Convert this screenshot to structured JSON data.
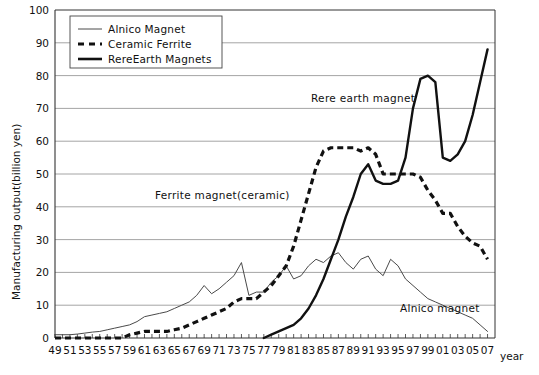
{
  "chart_data": {
    "type": "line",
    "title": "",
    "xlabel": "year",
    "ylabel": "Manufacturing output(billion yen)",
    "ylim": [
      0,
      100
    ],
    "ytick_step": 10,
    "yticks": [
      0,
      10,
      20,
      30,
      40,
      50,
      60,
      70,
      80,
      90,
      100
    ],
    "xlim": [
      49,
      108
    ],
    "xticks_labeled": [
      "49",
      "51",
      "53",
      "55",
      "57",
      "59",
      "61",
      "63",
      "65",
      "67",
      "69",
      "71",
      "73",
      "75",
      "77",
      "79",
      "81",
      "83",
      "85",
      "87",
      "89",
      "91",
      "93",
      "95",
      "97",
      "99",
      "01",
      "03",
      "05",
      "07"
    ],
    "xtick_minor_every_year": true,
    "grid": "horizontal",
    "legend_position": "top-left-inside",
    "series": [
      {
        "name": "Alnico Magnet",
        "style": "thin-solid",
        "color": "#4a4a4a",
        "x": [
          49,
          50,
          51,
          52,
          53,
          54,
          55,
          56,
          57,
          58,
          59,
          60,
          61,
          62,
          63,
          64,
          65,
          66,
          67,
          68,
          69,
          70,
          71,
          72,
          73,
          74,
          75,
          76,
          77,
          78,
          79,
          80,
          81,
          82,
          83,
          84,
          85,
          86,
          87,
          88,
          89,
          90,
          91,
          92,
          93,
          94,
          95,
          96,
          97,
          98,
          99,
          100,
          101,
          102,
          103,
          104,
          105,
          106,
          107
        ],
        "values": [
          1,
          1,
          1,
          1.2,
          1.5,
          1.8,
          2,
          2.5,
          3,
          3.5,
          4,
          5,
          6.5,
          7,
          7.5,
          8,
          9,
          10,
          11,
          13,
          16,
          13.5,
          15,
          17,
          19,
          23,
          13,
          14,
          14,
          17,
          19,
          22,
          18,
          19,
          22,
          24,
          23,
          25,
          26,
          23,
          21,
          24,
          25,
          21,
          19,
          24,
          22,
          18,
          16,
          14,
          12,
          11,
          10,
          9,
          8,
          7,
          6,
          4,
          2
        ]
      },
      {
        "name": "Ceramic Ferrite",
        "style": "thick-dashed",
        "color": "#111111",
        "x": [
          49,
          50,
          51,
          52,
          53,
          54,
          55,
          56,
          57,
          58,
          59,
          60,
          61,
          62,
          63,
          64,
          65,
          66,
          67,
          68,
          69,
          70,
          71,
          72,
          73,
          74,
          75,
          76,
          77,
          78,
          79,
          80,
          81,
          82,
          83,
          84,
          85,
          86,
          87,
          88,
          89,
          90,
          91,
          92,
          93,
          94,
          95,
          96,
          97,
          98,
          99,
          100,
          101,
          102,
          103,
          104,
          105,
          106,
          107
        ],
        "values": [
          0,
          0,
          0,
          0,
          0,
          0,
          0,
          0,
          0,
          0,
          1,
          1.5,
          2,
          2,
          2,
          2,
          2.5,
          3,
          4,
          5,
          6,
          7,
          8,
          9,
          11,
          12,
          12,
          12,
          14,
          16,
          19,
          22,
          28,
          36,
          44,
          52,
          57,
          58,
          58,
          58,
          58,
          57,
          58,
          56,
          50,
          50,
          50,
          50,
          50,
          49,
          45,
          42,
          38,
          38,
          34,
          31,
          29,
          28,
          24
        ]
      },
      {
        "name": "RereEarth Magnets",
        "style": "thick-solid",
        "color": "#111111",
        "x": [
          77,
          78,
          79,
          80,
          81,
          82,
          83,
          84,
          85,
          86,
          87,
          88,
          89,
          90,
          91,
          92,
          93,
          94,
          95,
          96,
          97,
          98,
          99,
          100,
          101,
          102,
          103,
          104,
          105,
          106,
          107
        ],
        "values": [
          0,
          1,
          2,
          3,
          4,
          6,
          9,
          13,
          18,
          24,
          30,
          37,
          43,
          50,
          53,
          48,
          47,
          47,
          48,
          55,
          70,
          79,
          80,
          78,
          55,
          54,
          56,
          60,
          68,
          78,
          88
        ]
      }
    ],
    "annotations": [
      {
        "text": "Rere earth magnet",
        "x_px": 311,
        "y_px": 102
      },
      {
        "text": "Ferrite magnet(ceramic)",
        "x_px": 155,
        "y_px": 199
      },
      {
        "text": "Alnico magnet",
        "x_px": 400,
        "y_px": 312
      }
    ]
  },
  "legend": {
    "items": [
      {
        "label": "Alnico Magnet",
        "swatch": "thin-solid"
      },
      {
        "label": "Ceramic Ferrite",
        "swatch": "thick-dashed"
      },
      {
        "label": "RereEarth Magnets",
        "swatch": "thick-solid"
      }
    ]
  },
  "axes": {
    "y_title": "Manufacturing output(billion yen)",
    "x_unit_label": "year"
  },
  "colors": {
    "axis": "#333333",
    "grid": "#9a9a9a",
    "thin_series": "#4a4a4a",
    "thick_series": "#111111",
    "background": "#ffffff"
  }
}
